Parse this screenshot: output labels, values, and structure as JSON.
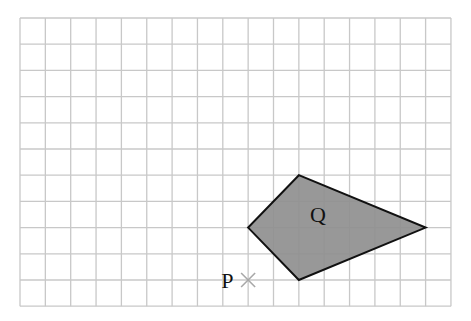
{
  "diagram": {
    "type": "grid-with-shape",
    "grid": {
      "columns": 17,
      "rows": 11,
      "origin_px": [
        20,
        18
      ],
      "cell_w": 25.35,
      "cell_h": 26.2,
      "line_color": "#c8c8c8"
    },
    "shape": {
      "label": "Q",
      "vertices_grid": [
        [
          11,
          6
        ],
        [
          16,
          8
        ],
        [
          11,
          10
        ],
        [
          9,
          8
        ]
      ],
      "fill": "#8f8f8f",
      "stroke": "#111111"
    },
    "point": {
      "label": "P",
      "grid": [
        9,
        10
      ],
      "marker": "cross-icon",
      "marker_color": "#a8a8a8"
    }
  }
}
